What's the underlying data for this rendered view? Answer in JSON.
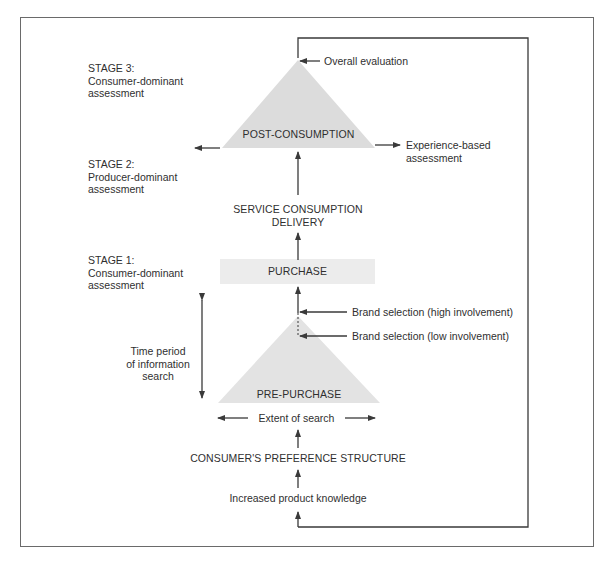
{
  "diagram": {
    "stages": [
      {
        "title": "STAGE 3:",
        "line1": "Consumer-dominant",
        "line2": "assessment"
      },
      {
        "title": "STAGE 2:",
        "line1": "Producer-dominant",
        "line2": "assessment"
      },
      {
        "title": "STAGE 1:",
        "line1": "Consumer-dominant",
        "line2": "assessment"
      }
    ],
    "nodes": {
      "post_consumption": "POST-CONSUMPTION",
      "service_line1": "SERVICE CONSUMPTION",
      "service_line2": "DELIVERY",
      "purchase": "PURCHASE",
      "pre_purchase": "PRE-PURCHASE",
      "preference_structure": "CONSUMER'S PREFERENCE STRUCTURE",
      "product_knowledge": "Increased product knowledge"
    },
    "annotations": {
      "overall_evaluation": "Overall evaluation",
      "experience_line1": "Experience-based",
      "experience_line2": "assessment",
      "brand_high": "Brand selection (high involvement)",
      "brand_low": "Brand selection (low involvement)",
      "time_line1": "Time period",
      "time_line2": "of information",
      "time_line3": "search",
      "extent_of_search": "Extent of search"
    },
    "colors": {
      "line": "#3a3a3a",
      "triangle_fill": "#dcdcdc",
      "purchase_fill": "#ececec",
      "frame": "#6a6a6a"
    }
  }
}
